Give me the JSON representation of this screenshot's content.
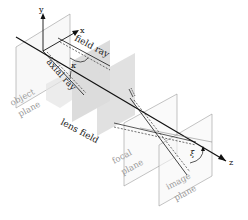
{
  "diagram": {
    "type": "optics-ray-diagram",
    "axes": {
      "x": "x",
      "y": "y",
      "z": "z"
    },
    "labels": {
      "field_ray": "field ray",
      "axial_ray": "axial ray",
      "lens_field": "lens field",
      "object_plane_1": "object",
      "object_plane_2": "plane",
      "focal_plane_1": "focal",
      "focal_plane_2": "plane",
      "image_plane_1": "image",
      "image_plane_2": "plane"
    },
    "angles": {
      "field_angle": "κ",
      "tilt_angle": "ξ"
    },
    "colors": {
      "lens_field": "#d9d9d9",
      "plane_outline": "#9a9a9a",
      "ray": "#111111",
      "plane_label": "#999999"
    }
  }
}
